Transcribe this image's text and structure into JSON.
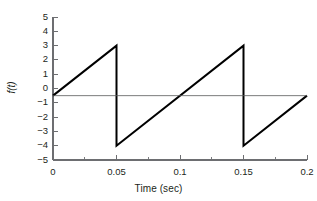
{
  "chart_data": {
    "type": "line",
    "title": "",
    "subtitle": "",
    "xlabel": "Time (sec)",
    "ylabel": "f(t)",
    "xlim": [
      0,
      0.2
    ],
    "ylim": [
      -5,
      5
    ],
    "grid": false,
    "legend": null,
    "xticks": [
      0,
      0.05,
      0.1,
      0.15,
      0.2
    ],
    "xtick_labels": [
      "0",
      "0.05",
      "0.1",
      "0.15",
      "0.2"
    ],
    "x_minor_tick_step": 0.025,
    "yticks": [
      5,
      4,
      3,
      2,
      1,
      0,
      -1,
      -2,
      -3,
      -4,
      -5
    ],
    "ytick_labels": [
      "5",
      "4",
      "3",
      "2",
      "1",
      "0",
      "−1",
      "−2",
      "−3",
      "−4",
      "−5"
    ],
    "series": [
      {
        "name": "f(t)",
        "description": "sawtooth wave, period 0.1 sec, amplitude from -4 to 3, mean level -0.5",
        "color": "#000000",
        "linewidth": 2,
        "x": [
          0,
          0.05,
          0.05,
          0.15,
          0.15,
          0.2
        ],
        "y": [
          -0.5,
          3,
          -4,
          3,
          -4,
          -0.5
        ]
      },
      {
        "name": "mean-level-line",
        "description": "thin horizontal reference line at f(t) = -0.5",
        "color": "#58595b",
        "linewidth": 0.8,
        "x": [
          0,
          0.2
        ],
        "y": [
          -0.5,
          -0.5
        ]
      }
    ],
    "annotations": [],
    "axis_color": "#6d6e71",
    "period_sec": 0.1,
    "peak_value": 3,
    "trough_value": -4,
    "start_value": -0.5,
    "end_value": -0.5
  },
  "figure": {
    "background_color": "#ffffff",
    "plot_area": {
      "left": 53,
      "top": 17,
      "right": 307,
      "bottom": 160
    }
  }
}
